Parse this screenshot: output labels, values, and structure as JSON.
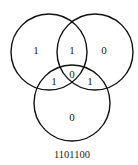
{
  "diagram": {
    "type": "venn-3",
    "circles": [
      {
        "name": "top-left",
        "cx": 49,
        "cy": 52,
        "r": 38
      },
      {
        "name": "top-right",
        "cx": 95,
        "cy": 52,
        "r": 38
      },
      {
        "name": "bottom",
        "cx": 72,
        "cy": 103,
        "r": 38
      }
    ],
    "regions": {
      "left_only": "1",
      "left_right": "1",
      "right_only": "0",
      "left_bottom": "1",
      "all_three": "0",
      "right_bottom": "1",
      "bottom_only": "0"
    },
    "code": "1101100"
  }
}
